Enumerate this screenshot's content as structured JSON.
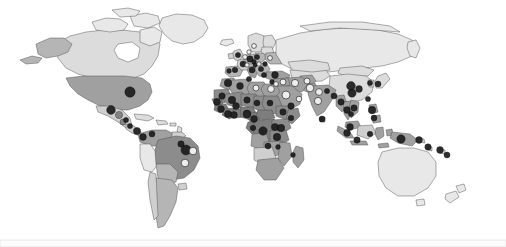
{
  "figure": {
    "type": "choropleth-point-map",
    "background_color": "#ffffff",
    "width": 506,
    "height": 247,
    "projection": "equirectangular-like",
    "border_color": "#4a4a4a"
  },
  "legend": {
    "visible": false,
    "entries": [
      {
        "key": "dark",
        "label": "Study location (dark marker)",
        "color": "#1d1d1d"
      },
      {
        "key": "light",
        "label": "Study location (light marker)",
        "color": "#f2f2f2"
      },
      {
        "key": "mid",
        "label": "Study location (mid-tone marker)",
        "color": "#808080"
      }
    ]
  },
  "choropleth": {
    "scale_name": "grayscale",
    "shades": {
      "very_light": "#e8e8e8",
      "light": "#dcdcdc",
      "light_mid": "#cfcfcf",
      "mid": "#b5b5b5",
      "mid_dark": "#a0a0a0",
      "dark": "#8c8c8c",
      "darker": "#7d7d7d"
    }
  },
  "regions": [
    {
      "name": "Canada",
      "shade": "light"
    },
    {
      "name": "Alaska",
      "shade": "mid"
    },
    {
      "name": "Greenland",
      "shade": "very_light"
    },
    {
      "name": "United States",
      "shade": "mid_dark"
    },
    {
      "name": "Mexico",
      "shade": "light_mid"
    },
    {
      "name": "Central America",
      "shade": "light_mid"
    },
    {
      "name": "Caribbean",
      "shade": "light"
    },
    {
      "name": "Colombia and Venezuela",
      "shade": "mid_dark"
    },
    {
      "name": "Peru and Ecuador",
      "shade": "very_light"
    },
    {
      "name": "Brazil",
      "shade": "dark"
    },
    {
      "name": "Bolivia and Paraguay",
      "shade": "mid"
    },
    {
      "name": "Argentina and Chile",
      "shade": "mid"
    },
    {
      "name": "Western Europe",
      "shade": "light_mid"
    },
    {
      "name": "Eastern Europe",
      "shade": "mid"
    },
    {
      "name": "Russia",
      "shade": "very_light"
    },
    {
      "name": "North Africa",
      "shade": "mid_dark"
    },
    {
      "name": "Sahel",
      "shade": "dark"
    },
    {
      "name": "West Africa",
      "shade": "darker"
    },
    {
      "name": "Central Africa",
      "shade": "darker"
    },
    {
      "name": "East Africa",
      "shade": "dark"
    },
    {
      "name": "Southern Africa",
      "shade": "mid_dark"
    },
    {
      "name": "Middle East",
      "shade": "mid_dark"
    },
    {
      "name": "Central Asia",
      "shade": "light"
    },
    {
      "name": "India",
      "shade": "mid_dark"
    },
    {
      "name": "China",
      "shade": "light"
    },
    {
      "name": "Mongolia",
      "shade": "light"
    },
    {
      "name": "Southeast Asia",
      "shade": "mid_dark"
    },
    {
      "name": "Indonesia",
      "shade": "mid_dark"
    },
    {
      "name": "Papua New Guinea",
      "shade": "mid_dark"
    },
    {
      "name": "Australia",
      "shade": "very_light"
    },
    {
      "name": "New Zealand",
      "shade": "very_light"
    },
    {
      "name": "Japan",
      "shade": "light"
    }
  ],
  "markers": [
    {
      "region": "United States",
      "x": 130,
      "y": 92,
      "r": 5.2,
      "tone": "dark"
    },
    {
      "region": "Mexico (north)",
      "x": 111,
      "y": 110,
      "r": 4.4,
      "tone": "dark"
    },
    {
      "region": "Mexico (south)",
      "x": 119,
      "y": 115,
      "r": 3.6,
      "tone": "mid"
    },
    {
      "region": "Guatemala",
      "x": 123,
      "y": 122,
      "r": 3.0,
      "tone": "mid"
    },
    {
      "region": "Honduras",
      "x": 126,
      "y": 120,
      "r": 2.6,
      "tone": "dark"
    },
    {
      "region": "Nicaragua",
      "x": 130,
      "y": 126,
      "r": 2.6,
      "tone": "dark"
    },
    {
      "region": "Panama",
      "x": 137,
      "y": 131,
      "r": 3.6,
      "tone": "dark"
    },
    {
      "region": "Colombia",
      "x": 143,
      "y": 137,
      "r": 3.4,
      "tone": "dark"
    },
    {
      "region": "Venezuela",
      "x": 152,
      "y": 134,
      "r": 3.0,
      "tone": "dark"
    },
    {
      "region": "Brazil (northeast)",
      "x": 181,
      "y": 144,
      "r": 3.2,
      "tone": "dark"
    },
    {
      "region": "Brazil (east)",
      "x": 186,
      "y": 150,
      "r": 5.0,
      "tone": "dark"
    },
    {
      "region": "Brazil (coast)",
      "x": 193,
      "y": 151,
      "r": 3.8,
      "tone": "light"
    },
    {
      "region": "Brazil (southeast)",
      "x": 185,
      "y": 163,
      "r": 3.8,
      "tone": "light"
    },
    {
      "region": "Portugal",
      "x": 229,
      "y": 71,
      "r": 2.4,
      "tone": "dark"
    },
    {
      "region": "Spain",
      "x": 235,
      "y": 70,
      "r": 2.8,
      "tone": "dark"
    },
    {
      "region": "France",
      "x": 243,
      "y": 64,
      "r": 3.0,
      "tone": "dark"
    },
    {
      "region": "United Kingdom",
      "x": 238,
      "y": 55,
      "r": 2.6,
      "tone": "dark"
    },
    {
      "region": "Netherlands",
      "x": 245,
      "y": 57,
      "r": 2.4,
      "tone": "light"
    },
    {
      "region": "Germany",
      "x": 250,
      "y": 59,
      "r": 3.2,
      "tone": "dark"
    },
    {
      "region": "Denmark",
      "x": 249,
      "y": 52,
      "r": 2.2,
      "tone": "light"
    },
    {
      "region": "Sweden",
      "x": 254,
      "y": 46,
      "r": 2.4,
      "tone": "light"
    },
    {
      "region": "Poland",
      "x": 257,
      "y": 57,
      "r": 2.6,
      "tone": "dark"
    },
    {
      "region": "Czechia",
      "x": 254,
      "y": 62,
      "r": 2.4,
      "tone": "dark"
    },
    {
      "region": "Switzerland",
      "x": 247,
      "y": 65,
      "r": 2.2,
      "tone": "light"
    },
    {
      "region": "Italy",
      "x": 252,
      "y": 70,
      "r": 3.0,
      "tone": "dark"
    },
    {
      "region": "Austria",
      "x": 255,
      "y": 65,
      "r": 2.2,
      "tone": "dark"
    },
    {
      "region": "Hungary",
      "x": 259,
      "y": 64,
      "r": 2.2,
      "tone": "light"
    },
    {
      "region": "Balkans",
      "x": 261,
      "y": 69,
      "r": 2.6,
      "tone": "dark"
    },
    {
      "region": "Greece",
      "x": 264,
      "y": 75,
      "r": 2.6,
      "tone": "dark"
    },
    {
      "region": "Romania",
      "x": 265,
      "y": 64,
      "r": 2.4,
      "tone": "dark"
    },
    {
      "region": "Ukraine",
      "x": 270,
      "y": 58,
      "r": 2.4,
      "tone": "light"
    },
    {
      "region": "Turkey",
      "x": 275,
      "y": 75,
      "r": 3.4,
      "tone": "dark"
    },
    {
      "region": "Morocco",
      "x": 228,
      "y": 83,
      "r": 3.8,
      "tone": "dark"
    },
    {
      "region": "Algeria",
      "x": 240,
      "y": 86,
      "r": 3.4,
      "tone": "dark"
    },
    {
      "region": "Tunisia",
      "x": 249,
      "y": 79,
      "r": 2.6,
      "tone": "dark"
    },
    {
      "region": "Libya",
      "x": 256,
      "y": 88,
      "r": 3.0,
      "tone": "light"
    },
    {
      "region": "Egypt",
      "x": 271,
      "y": 89,
      "r": 3.4,
      "tone": "light"
    },
    {
      "region": "Israel",
      "x": 272,
      "y": 82,
      "r": 2.4,
      "tone": "dark"
    },
    {
      "region": "Jordan",
      "x": 276,
      "y": 84,
      "r": 2.4,
      "tone": "light"
    },
    {
      "region": "Saudi Arabia",
      "x": 286,
      "y": 95,
      "r": 4.0,
      "tone": "light"
    },
    {
      "region": "Iraq",
      "x": 283,
      "y": 82,
      "r": 3.0,
      "tone": "light"
    },
    {
      "region": "Iran",
      "x": 295,
      "y": 83,
      "r": 3.6,
      "tone": "light"
    },
    {
      "region": "Yemen",
      "x": 291,
      "y": 106,
      "r": 3.2,
      "tone": "dark"
    },
    {
      "region": "Oman",
      "x": 299,
      "y": 99,
      "r": 2.8,
      "tone": "light"
    },
    {
      "region": "Pakistan",
      "x": 310,
      "y": 88,
      "r": 3.8,
      "tone": "light"
    },
    {
      "region": "Afghanistan",
      "x": 307,
      "y": 81,
      "r": 3.0,
      "tone": "light"
    },
    {
      "region": "Mauritania",
      "x": 222,
      "y": 96,
      "r": 3.2,
      "tone": "dark"
    },
    {
      "region": "Senegal",
      "x": 217,
      "y": 102,
      "r": 3.4,
      "tone": "dark"
    },
    {
      "region": "Mali",
      "x": 232,
      "y": 100,
      "r": 3.8,
      "tone": "dark"
    },
    {
      "region": "Guinea",
      "x": 221,
      "y": 109,
      "r": 3.4,
      "tone": "dark"
    },
    {
      "region": "Burkina Faso",
      "x": 236,
      "y": 106,
      "r": 3.4,
      "tone": "dark"
    },
    {
      "region": "Niger",
      "x": 247,
      "y": 100,
      "r": 3.2,
      "tone": "dark"
    },
    {
      "region": "Cote d'Ivoire",
      "x": 228,
      "y": 114,
      "r": 3.6,
      "tone": "dark"
    },
    {
      "region": "Ghana",
      "x": 234,
      "y": 115,
      "r": 3.4,
      "tone": "dark"
    },
    {
      "region": "Nigeria",
      "x": 247,
      "y": 114,
      "r": 4.0,
      "tone": "dark"
    },
    {
      "region": "Cameroon",
      "x": 254,
      "y": 119,
      "r": 3.4,
      "tone": "dark"
    },
    {
      "region": "Chad",
      "x": 257,
      "y": 103,
      "r": 3.0,
      "tone": "dark"
    },
    {
      "region": "Sudan",
      "x": 270,
      "y": 103,
      "r": 3.0,
      "tone": "dark"
    },
    {
      "region": "Ethiopia",
      "x": 283,
      "y": 112,
      "r": 3.2,
      "tone": "dark"
    },
    {
      "region": "Somalia",
      "x": 291,
      "y": 118,
      "r": 2.8,
      "tone": "dark"
    },
    {
      "region": "Uganda",
      "x": 275,
      "y": 127,
      "r": 3.6,
      "tone": "dark"
    },
    {
      "region": "Kenya",
      "x": 281,
      "y": 128,
      "r": 3.8,
      "tone": "dark"
    },
    {
      "region": "DR Congo",
      "x": 263,
      "y": 131,
      "r": 4.2,
      "tone": "dark"
    },
    {
      "region": "Tanzania",
      "x": 277,
      "y": 137,
      "r": 3.8,
      "tone": "dark"
    },
    {
      "region": "Gabon",
      "x": 253,
      "y": 128,
      "r": 2.8,
      "tone": "dark"
    },
    {
      "region": "Zambia",
      "x": 268,
      "y": 146,
      "r": 3.0,
      "tone": "dark"
    },
    {
      "region": "Malawi",
      "x": 278,
      "y": 147,
      "r": 2.4,
      "tone": "dark"
    },
    {
      "region": "India (north)",
      "x": 319,
      "y": 92,
      "r": 3.4,
      "tone": "light"
    },
    {
      "region": "India (central)",
      "x": 318,
      "y": 101,
      "r": 3.6,
      "tone": "light"
    },
    {
      "region": "Sri Lanka",
      "x": 322,
      "y": 119,
      "r": 3.0,
      "tone": "dark"
    },
    {
      "region": "Nepal",
      "x": 327,
      "y": 91,
      "r": 2.6,
      "tone": "dark"
    },
    {
      "region": "Bangladesh",
      "x": 334,
      "y": 96,
      "r": 3.0,
      "tone": "dark"
    },
    {
      "region": "Myanmar",
      "x": 341,
      "y": 102,
      "r": 3.2,
      "tone": "dark"
    },
    {
      "region": "China (south)",
      "x": 352,
      "y": 93,
      "r": 4.2,
      "tone": "dark"
    },
    {
      "region": "China (central)",
      "x": 351,
      "y": 86,
      "r": 4.4,
      "tone": "dark"
    },
    {
      "region": "China (east)",
      "x": 359,
      "y": 89,
      "r": 3.4,
      "tone": "dark"
    },
    {
      "region": "Thailand",
      "x": 347,
      "y": 110,
      "r": 3.4,
      "tone": "dark"
    },
    {
      "region": "Vietnam",
      "x": 354,
      "y": 108,
      "r": 3.2,
      "tone": "dark"
    },
    {
      "region": "Cambodia",
      "x": 351,
      "y": 114,
      "r": 2.6,
      "tone": "dark"
    },
    {
      "region": "Malaysia",
      "x": 350,
      "y": 127,
      "r": 3.4,
      "tone": "dark"
    },
    {
      "region": "Philippines",
      "x": 372,
      "y": 110,
      "r": 3.8,
      "tone": "dark"
    },
    {
      "region": "Philippines (south)",
      "x": 374,
      "y": 118,
      "r": 3.0,
      "tone": "dark"
    },
    {
      "region": "Taiwan",
      "x": 368,
      "y": 99,
      "r": 2.6,
      "tone": "dark"
    },
    {
      "region": "Japan",
      "x": 378,
      "y": 84,
      "r": 3.0,
      "tone": "dark"
    },
    {
      "region": "Korea",
      "x": 370,
      "y": 83,
      "r": 2.6,
      "tone": "dark"
    },
    {
      "region": "Indonesia (Sumatra)",
      "x": 347,
      "y": 133,
      "r": 3.4,
      "tone": "dark"
    },
    {
      "region": "Indonesia (Java)",
      "x": 357,
      "y": 140,
      "r": 3.2,
      "tone": "dark"
    },
    {
      "region": "Indonesia (Sulawesi)",
      "x": 370,
      "y": 134,
      "r": 2.8,
      "tone": "dark"
    },
    {
      "region": "Papua New Guinea",
      "x": 401,
      "y": 139,
      "r": 4.2,
      "tone": "dark"
    },
    {
      "region": "Solomon Islands",
      "x": 419,
      "y": 140,
      "r": 3.4,
      "tone": "dark"
    },
    {
      "region": "Vanuatu",
      "x": 428,
      "y": 147,
      "r": 3.2,
      "tone": "dark"
    },
    {
      "region": "Fiji",
      "x": 440,
      "y": 150,
      "r": 3.4,
      "tone": "dark"
    },
    {
      "region": "New Caledonia",
      "x": 447,
      "y": 155,
      "r": 3.0,
      "tone": "dark"
    },
    {
      "region": "Madagascar",
      "x": 293,
      "y": 155,
      "r": 2.4,
      "tone": "dark"
    }
  ]
}
